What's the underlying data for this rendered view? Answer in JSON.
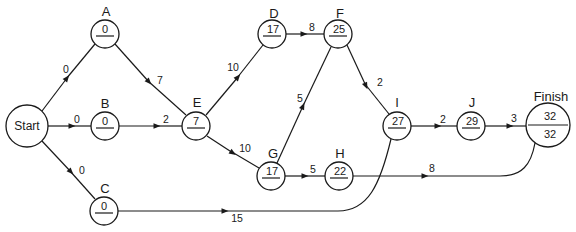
{
  "diagram": {
    "type": "activity-network",
    "nodes": {
      "start": {
        "label": "Start",
        "x": 27,
        "y": 126,
        "r": 21
      },
      "a": {
        "label": "A",
        "value": "0",
        "x": 105,
        "y": 34,
        "r": 14
      },
      "b": {
        "label": "B",
        "value": "0",
        "x": 105,
        "y": 126,
        "r": 14
      },
      "c": {
        "label": "C",
        "value": "0",
        "x": 104,
        "y": 211,
        "r": 14
      },
      "d": {
        "label": "D",
        "value": "17",
        "x": 272,
        "y": 34,
        "r": 14
      },
      "e": {
        "label": "E",
        "value": "7",
        "x": 196,
        "y": 126,
        "r": 14
      },
      "f": {
        "label": "F",
        "value": "25",
        "x": 338,
        "y": 34,
        "r": 14
      },
      "g": {
        "label": "G",
        "value": "17",
        "x": 271,
        "y": 176,
        "r": 14
      },
      "h": {
        "label": "H",
        "value": "22",
        "x": 339,
        "y": 175,
        "r": 14
      },
      "i": {
        "label": "I",
        "value": "27",
        "x": 397,
        "y": 126,
        "r": 14
      },
      "j": {
        "label": "J",
        "value": "29",
        "x": 471,
        "y": 126,
        "r": 14
      },
      "finish": {
        "label": "Finish",
        "value_top": "32",
        "value_bottom": "32",
        "x": 548,
        "y": 125,
        "r": 22
      }
    },
    "edges": {
      "start_a": {
        "from": "Start",
        "to": "A",
        "weight": "0"
      },
      "start_b": {
        "from": "Start",
        "to": "B",
        "weight": "0"
      },
      "start_c": {
        "from": "Start",
        "to": "C",
        "weight": "0"
      },
      "a_e": {
        "from": "A",
        "to": "E",
        "weight": "7"
      },
      "b_e": {
        "from": "B",
        "to": "E",
        "weight": "2"
      },
      "e_d": {
        "from": "E",
        "to": "D",
        "weight": "10"
      },
      "e_g": {
        "from": "E",
        "to": "G",
        "weight": "10"
      },
      "d_f": {
        "from": "D",
        "to": "F",
        "weight": "8"
      },
      "g_f": {
        "from": "G",
        "to": "F",
        "weight": "5"
      },
      "g_h": {
        "from": "G",
        "to": "H",
        "weight": "5"
      },
      "f_i": {
        "from": "F",
        "to": "I",
        "weight": "2"
      },
      "i_j": {
        "from": "I",
        "to": "J",
        "weight": "2"
      },
      "j_finish": {
        "from": "J",
        "to": "Finish",
        "weight": "3"
      },
      "h_finish": {
        "from": "H",
        "to": "Finish",
        "weight": "8"
      },
      "c_i": {
        "from": "C",
        "to": "I",
        "weight": "15"
      }
    },
    "colors": {
      "stroke": "#1a1a1a",
      "background": "#ffffff"
    }
  }
}
